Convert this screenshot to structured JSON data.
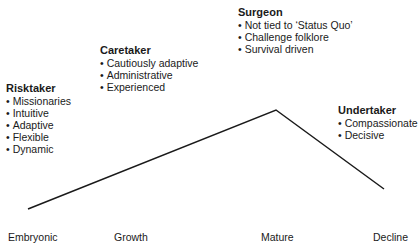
{
  "diagram": {
    "type": "lifecycle-curve",
    "line_color": "#1a1a1a",
    "curve_points": [
      [
        28,
        209
      ],
      [
        276,
        110
      ],
      [
        384,
        189
      ]
    ],
    "roles": [
      {
        "title": "Risktaker",
        "items": [
          "Missionaries",
          "Intuitive",
          "Adaptive",
          "Flexible",
          "Dynamic"
        ]
      },
      {
        "title": "Caretaker",
        "items": [
          "Cautiously adaptive",
          "Administrative",
          "Experienced"
        ]
      },
      {
        "title": "Surgeon",
        "items": [
          "Not tied to ‘Status Quo’",
          "Challenge folklore",
          "Survival driven"
        ]
      },
      {
        "title": "Undertaker",
        "items": [
          "Compassionate",
          "Decisive"
        ]
      }
    ],
    "stages": [
      "Embryonic",
      "Growth",
      "Mature",
      "Decline"
    ]
  }
}
